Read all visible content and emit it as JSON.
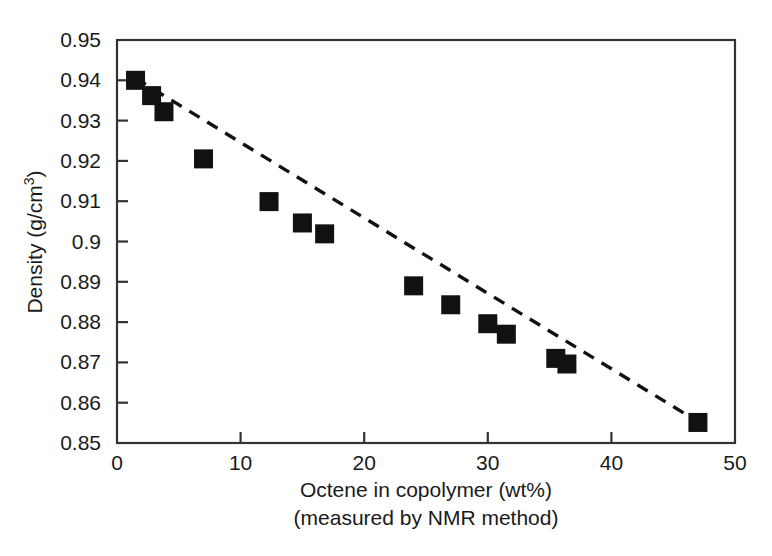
{
  "chart_data": {
    "type": "scatter",
    "title": "",
    "xlabel": "Octene in copolymer (wt%)",
    "xlabel_line2": "(measured by NMR method)",
    "ylabel": "Density (g/cm",
    "ylabel_sup": "3",
    "ylabel_close": ")",
    "xlim": [
      0,
      50
    ],
    "ylim": [
      0.85,
      0.95
    ],
    "xticks": [
      0,
      10,
      20,
      30,
      40,
      50
    ],
    "xtick_labels": [
      "0",
      "10",
      "20",
      "30",
      "40",
      "50"
    ],
    "yticks": [
      0.85,
      0.86,
      0.87,
      0.88,
      0.89,
      0.9,
      0.91,
      0.92,
      0.93,
      0.94,
      0.95
    ],
    "ytick_labels": [
      "0.85",
      "0.86",
      "0.87",
      "0.88",
      "0.89",
      "0.9",
      "0.91",
      "0.92",
      "0.93",
      "0.94",
      "0.95"
    ],
    "grid": false,
    "legend": false,
    "marker": "filled-square",
    "marker_color": "#111111",
    "trendline": {
      "style": "dashed",
      "color": "#111111",
      "points_x": [
        1.5,
        47.0
      ],
      "points_y": [
        0.9405,
        0.8553
      ]
    },
    "series": [
      {
        "name": "Density vs octene content",
        "x": [
          1.5,
          2.8,
          3.8,
          7.0,
          12.3,
          15.0,
          16.8,
          24.0,
          27.0,
          30.0,
          31.5,
          35.5,
          36.4,
          47.0
        ],
        "y": [
          0.94,
          0.9362,
          0.9322,
          0.9205,
          0.9099,
          0.9046,
          0.9019,
          0.889,
          0.8843,
          0.8796,
          0.877,
          0.871,
          0.8696,
          0.8551
        ]
      }
    ]
  },
  "axes": {
    "frame_color": "#333333",
    "background": "#ffffff"
  }
}
